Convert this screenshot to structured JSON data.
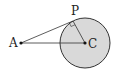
{
  "diagram": {
    "type": "geometry",
    "colors": {
      "circle_fill": "#d9d9d9",
      "stroke": "#333333",
      "background": "#ffffff"
    },
    "points": {
      "A": {
        "label": "A",
        "x": 21,
        "y": 43
      },
      "C": {
        "label": "C",
        "x": 85,
        "y": 43
      },
      "P": {
        "label": "P",
        "x": 73,
        "y": 21
      }
    },
    "circle": {
      "center": "C",
      "radius": 25
    },
    "segments": [
      {
        "from": "A",
        "to": "P",
        "name": "tangent"
      },
      {
        "from": "A",
        "to": "C",
        "name": "center-line"
      },
      {
        "from": "C",
        "to": "P",
        "name": "radius"
      }
    ],
    "right_angle_at": "P"
  }
}
